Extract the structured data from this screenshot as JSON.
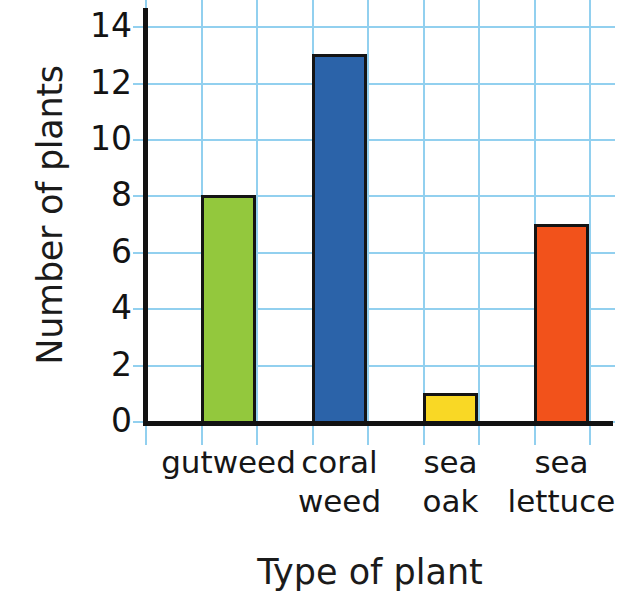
{
  "chart_data": {
    "type": "bar",
    "title": "",
    "xlabel": "Type of plant",
    "ylabel": "Number of plants",
    "categories": [
      "gutweed",
      "coral\nweed",
      "sea\noak",
      "sea\nlettuce"
    ],
    "values": [
      8,
      13,
      1,
      7
    ],
    "bar_colors": [
      "#93c83d",
      "#2b63a9",
      "#f9d825",
      "#f2521b"
    ],
    "bar_outline_color": "#141414",
    "ylim": [
      0,
      14
    ],
    "ytick_labels": [
      "0",
      "2",
      "4",
      "6",
      "8",
      "10",
      "12",
      "14"
    ],
    "ytick_values": [
      0,
      2,
      4,
      6,
      8,
      10,
      12,
      14
    ],
    "grid": true,
    "grid_color": "#92d0ef",
    "legend": "none",
    "axis_color": "#121212",
    "background_color": "#ffffff"
  },
  "axes": {
    "y_title": "Number of plants",
    "x_title": "Type of plant"
  },
  "ticks": {
    "y": [
      "14",
      "12",
      "10",
      "8",
      "6",
      "4",
      "2",
      "0"
    ]
  },
  "categories": {
    "c0": "gutweed",
    "c1": "coral\nweed",
    "c2": "sea\noak",
    "c3": "sea\nlettuce"
  }
}
